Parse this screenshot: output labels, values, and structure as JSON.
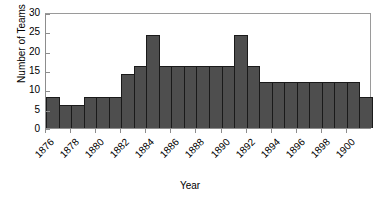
{
  "chart_data": {
    "type": "bar",
    "title": "",
    "xlabel": "Year",
    "ylabel": "Number of Teams",
    "ylim": [
      0,
      30
    ],
    "ytick_values": [
      0,
      5,
      10,
      15,
      20,
      25,
      30
    ],
    "ytick_labels": [
      "0",
      "5",
      "10",
      "15",
      "20",
      "25",
      "30"
    ],
    "xtick_labels": [
      "1876",
      "1878",
      "1880",
      "1882",
      "1884",
      "1886",
      "1888",
      "1890",
      "1892",
      "1894",
      "1896",
      "1898",
      "1900"
    ],
    "xtick_categories": [
      1876,
      1878,
      1880,
      1882,
      1884,
      1886,
      1888,
      1890,
      1892,
      1894,
      1896,
      1898,
      1900
    ],
    "grid": false,
    "legend": null,
    "bar_color": "#4e4e4e",
    "bar_edge_color": "#1a1a1a",
    "axis_color": "#8d8d8d",
    "categories": [
      1876,
      1877,
      1878,
      1879,
      1880,
      1881,
      1882,
      1883,
      1884,
      1885,
      1886,
      1887,
      1888,
      1889,
      1890,
      1891,
      1892,
      1893,
      1894,
      1895,
      1896,
      1897,
      1898,
      1899,
      1900,
      1901
    ],
    "values": [
      8,
      6,
      6,
      8,
      8,
      8,
      14,
      16,
      24,
      16,
      16,
      16,
      16,
      16,
      16,
      24,
      16,
      12,
      12,
      12,
      12,
      12,
      12,
      12,
      12,
      8
    ]
  }
}
